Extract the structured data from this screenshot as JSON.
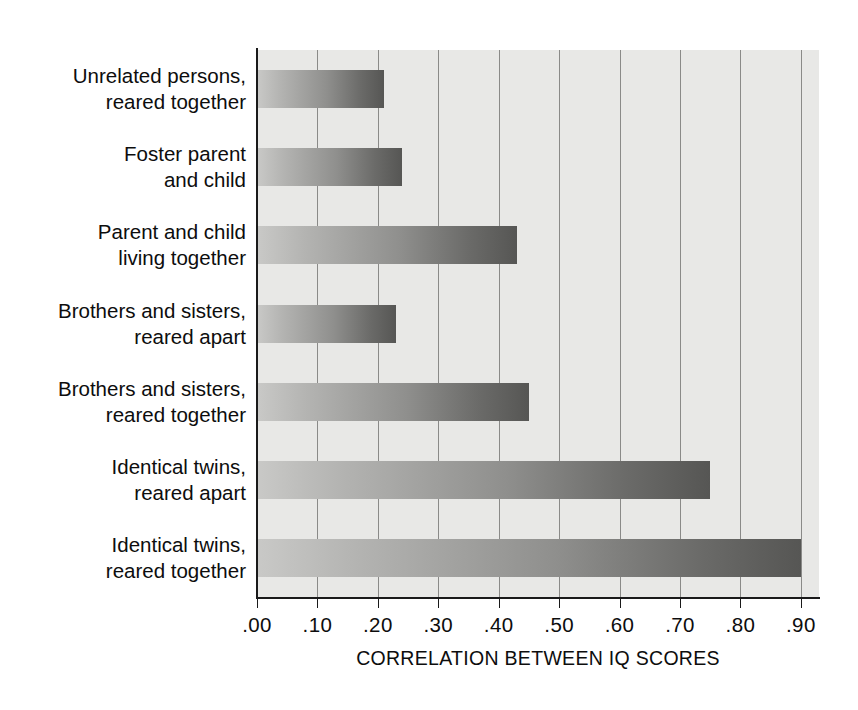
{
  "chart_data": {
    "type": "bar",
    "orientation": "horizontal",
    "title": "",
    "subtitle": "",
    "xlabel": "CORRELATION BETWEEN IQ SCORES",
    "ylabel": "",
    "xlim": [
      0.0,
      0.93
    ],
    "ylim": null,
    "grid": "vertical",
    "legend": "none",
    "xticks": [
      0.0,
      0.1,
      0.2,
      0.3,
      0.4,
      0.5,
      0.6,
      0.7,
      0.8,
      0.9
    ],
    "xticklabels": [
      ".00",
      ".10",
      ".20",
      ".30",
      ".40",
      ".50",
      ".60",
      ".70",
      ".80",
      ".90"
    ],
    "categories": [
      "Unrelated persons,\nreared together",
      "Foster parent\nand child",
      "Parent and child\nliving together",
      "Brothers and sisters,\nreared apart",
      "Brothers and sisters,\nreared together",
      "Identical twins,\nreared apart",
      "Identical twins,\nreared together"
    ],
    "values": [
      0.21,
      0.24,
      0.43,
      0.23,
      0.45,
      0.75,
      0.9
    ],
    "bar_fill": "gray-gradient-left-light-to-right-dark",
    "colors": {
      "plot_background": "#e8e8e6",
      "page_background": "#ffffff",
      "axis": "#1a1a1a",
      "gridline": "#8a8a88",
      "bar_light": "#c9c9c7",
      "bar_dark": "#565654",
      "text": "#0d0d0d"
    }
  }
}
